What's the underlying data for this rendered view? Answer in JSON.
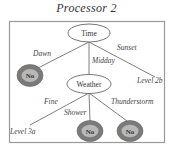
{
  "title": "Processor 2",
  "colors": {
    "frame": "#9a9a9a",
    "edge": "#707070",
    "leaf_outer": "#7a7a7a",
    "leaf_inner": "#b8b8b8",
    "text": "#333333"
  },
  "nodes": {
    "root": {
      "label": "Time"
    },
    "weather": {
      "label": "Weather"
    },
    "no_dawn": {
      "label": "No"
    },
    "level_2b": {
      "label": "Level 2b"
    },
    "level_3a": {
      "label": "Level 3a"
    },
    "no_shower": {
      "label": "No"
    },
    "no_thunderstorm": {
      "label": "No"
    }
  },
  "edges": {
    "dawn": "Dawn",
    "midday": "Midday",
    "sunset": "Sunset",
    "fine": "Fine",
    "shower": "Shower",
    "thunderstorm": "Thunderstorm"
  }
}
